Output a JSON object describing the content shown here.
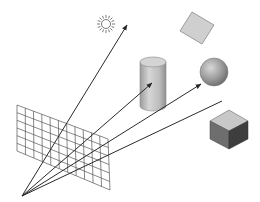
{
  "diagram": {
    "eye_point": {
      "x": 22,
      "y": 196
    },
    "image_plane": {
      "label": "image-plane-grid",
      "corners": {
        "tl": [
          17,
          105
        ],
        "tr": [
          108,
          139
        ],
        "br": [
          110,
          190
        ],
        "bl": [
          17,
          151
        ]
      },
      "cols": 11,
      "rows": 6,
      "stroke": "#555555"
    },
    "rays": [
      {
        "name": "ray-to-light",
        "to": [
          127,
          25
        ]
      },
      {
        "name": "ray-to-cylinder",
        "to": [
          152,
          82
        ]
      },
      {
        "name": "ray-to-sphere",
        "to": [
          201,
          84
        ]
      }
    ],
    "extra_ray": {
      "name": "ray-past-sphere",
      "to": [
        222,
        101
      ]
    },
    "objects": {
      "light": {
        "name": "sun-light",
        "cx": 106,
        "cy": 24,
        "r": 5
      },
      "square": {
        "name": "tilted-square",
        "fill": "#cccccc"
      },
      "cylinder": {
        "name": "cylinder",
        "fill": "#bdbdbd"
      },
      "sphere": {
        "name": "sphere",
        "fill": "#9a9a9a"
      },
      "cube": {
        "name": "cube",
        "top": "#c8c8c8",
        "left": "#6e6e6e",
        "right": "#3e3e3e"
      }
    },
    "colors": {
      "ray": "#2a2a2a",
      "grid": "#555555",
      "background": "#ffffff"
    }
  }
}
